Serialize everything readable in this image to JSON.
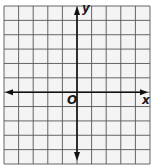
{
  "figure": {
    "type": "coordinate-plane",
    "grid": {
      "columns": 10,
      "rows": 11,
      "left": 4,
      "top": 6,
      "right": 150,
      "bottom": 164,
      "line_color": "#555555",
      "background": "#f4f4f4"
    },
    "axes": {
      "x_axis_row": 6,
      "y_axis_col": 5,
      "color": "#111111",
      "x_label": "x",
      "y_label": "y",
      "origin_label": "O"
    }
  }
}
